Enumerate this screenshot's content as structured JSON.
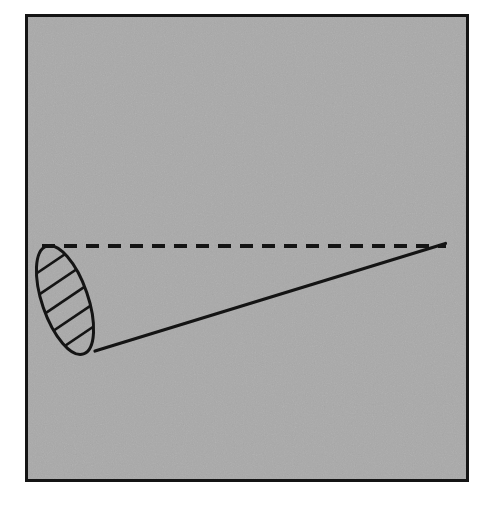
{
  "figure": {
    "title": "Oblique cone with dashed axis",
    "canvas": {
      "width": 491,
      "height": 509,
      "outside_color": "#ffffff"
    },
    "panel": {
      "name": "diagram panel",
      "x": 25,
      "y": 14,
      "width": 444,
      "height": 468,
      "fill_color": "#a8a8a8",
      "border_color": "#111111",
      "border_width": 3,
      "texture": "fine grain noise"
    },
    "stroke_color": "#111111",
    "elements": [
      {
        "name": "cone-base-ellipse",
        "type": "ellipse",
        "center_x": 65,
        "center_y": 300,
        "radius_x": 23,
        "radius_y": 57,
        "rotation_deg": -19,
        "stroke_width": 3,
        "fill": "none",
        "hatched": true
      },
      {
        "name": "hatch-fill",
        "type": "hatching",
        "line_count": 6,
        "angle_deg": -34,
        "spacing_px": 19,
        "stroke_width": 2.6
      },
      {
        "name": "cone-axis-dashed-line",
        "type": "dashed-line",
        "x1": 42,
        "y1": 246,
        "x2": 445,
        "y2": 246,
        "dash_length": 12,
        "dash_gap": 9,
        "stroke_width": 4
      },
      {
        "name": "cone-slant-line",
        "type": "line",
        "x1": 95,
        "y1": 351,
        "x2": 445,
        "y2": 244,
        "stroke_width": 3.2
      },
      {
        "name": "cone-apex",
        "type": "point",
        "x": 445,
        "y": 244
      }
    ]
  }
}
